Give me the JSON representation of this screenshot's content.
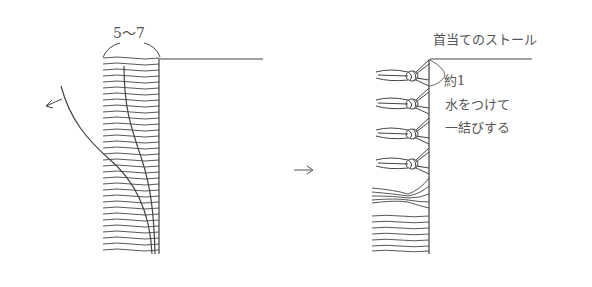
{
  "diagram": {
    "left_figure": {
      "measurement_label": "5〜7",
      "description": "stole edge with fringe threads unraveled; curved lines show threads being pulled away"
    },
    "transition_arrow": "→",
    "right_figure": {
      "title": "首当てのストール",
      "measurement_label": "約1",
      "instruction_line1": "水をつけて",
      "instruction_line2": "一結びする",
      "knot_count": 4
    },
    "colors": {
      "line": "#444444",
      "text": "#555555",
      "background": "#ffffff"
    }
  }
}
